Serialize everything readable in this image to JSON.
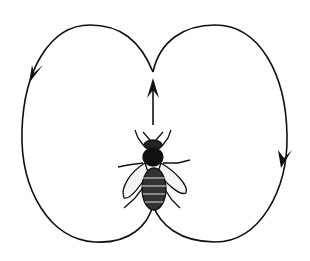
{
  "diagram": {
    "elements": [
      {
        "id": "left-loop",
        "label": "left return loop",
        "direction": "counterclockwise"
      },
      {
        "id": "right-loop",
        "label": "right return loop",
        "direction": "clockwise"
      },
      {
        "id": "waggle-run",
        "label": "straight waggle run",
        "direction": "up"
      },
      {
        "id": "bee",
        "label": "honeybee"
      }
    ],
    "colors": {
      "line": "#111111",
      "background": "#ffffff"
    }
  }
}
